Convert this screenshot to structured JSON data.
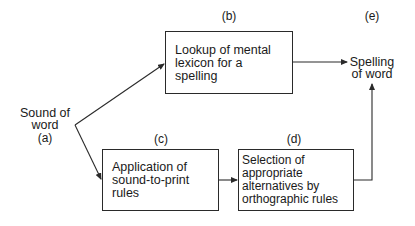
{
  "diagram": {
    "type": "flowchart",
    "nodes": [
      {
        "id": "a",
        "tag": "(a)",
        "text": "Sound of\nword",
        "shape": "text"
      },
      {
        "id": "b",
        "tag": "(b)",
        "text": "Lookup of mental\nlexicon for a\nspelling",
        "shape": "box"
      },
      {
        "id": "c",
        "tag": "(c)",
        "text": "Application of\nsound-to-print\nrules",
        "shape": "box"
      },
      {
        "id": "d",
        "tag": "(d)",
        "text": "Selection of\nappropriate\nalternatives by\northographic rules",
        "shape": "box"
      },
      {
        "id": "e",
        "tag": "(e)",
        "text": "Spelling\nof word",
        "shape": "text"
      }
    ],
    "edges": [
      {
        "from": "a",
        "to": "b"
      },
      {
        "from": "a",
        "to": "c"
      },
      {
        "from": "b",
        "to": "e"
      },
      {
        "from": "c",
        "to": "d"
      },
      {
        "from": "d",
        "to": "e"
      }
    ],
    "colors": {
      "line": "#2a2a2a",
      "text": "#1a1a1a",
      "background": "#ffffff"
    }
  }
}
